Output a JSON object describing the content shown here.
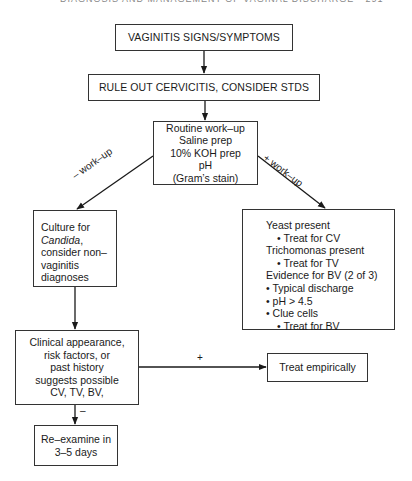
{
  "header": {
    "text": "DIAGNOSIS AND MANAGEMENT OF VAGINAL DISCHARGE  •  291"
  },
  "nodes": {
    "signs": {
      "text": "VAGINITIS SIGNS/SYMPTOMS"
    },
    "rule_out": {
      "text": "RULE OUT CERVICITIS, CONSIDER STDS"
    },
    "routine": {
      "lines": [
        "Routine work–up",
        "Saline prep",
        "10% KOH prep",
        "pH",
        "(Gram’s stain)"
      ]
    },
    "culture": {
      "line1": "Culture for",
      "line2_italic": "Candida",
      "line2_suffix": ",",
      "line3": "consider non–",
      "line4": "vaginitis",
      "line5": "diagnoses"
    },
    "findings": {
      "lines": [
        {
          "text": "Yeast present",
          "indent": 0
        },
        {
          "text": "• Treat for CV",
          "indent": 1
        },
        {
          "text": "Trichomonas present",
          "indent": 0
        },
        {
          "text": "• Treat for TV",
          "indent": 1
        },
        {
          "text": "Evidence for BV (2 of 3)",
          "indent": 0
        },
        {
          "text": "• Typical discharge",
          "indent": 0
        },
        {
          "text": "• pH > 4.5",
          "indent": 0
        },
        {
          "text": "• Clue cells",
          "indent": 0
        },
        {
          "text": "• Treat for BV",
          "indent": 1
        }
      ]
    },
    "clinical": {
      "lines": [
        "Clinical appearance,",
        "risk factors, or",
        "past history",
        "suggests possible",
        "CV, TV, BV,"
      ]
    },
    "treat_empirically": {
      "text": "Treat empirically"
    },
    "reexamine": {
      "lines": [
        "Re–examine in",
        "3–5 days"
      ]
    }
  },
  "edges": {
    "neg_workup_label": "–  work–up",
    "pos_workup_label": "+  work–up",
    "plus_label": "+",
    "minus_label": "–"
  }
}
